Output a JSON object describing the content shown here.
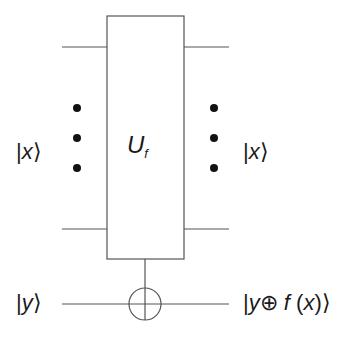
{
  "diagram": {
    "gate": {
      "name": "U",
      "subscript": "f"
    },
    "inputs": {
      "x_label_open": "|",
      "x_label_var": "x",
      "x_label_close": "⟩",
      "y_label_open": "|",
      "y_label_var": "y",
      "y_label_close": "⟩"
    },
    "outputs": {
      "x_label_open": "|",
      "x_label_var": "x",
      "x_label_close": "⟩",
      "y_label_open": "|",
      "y_expr_y": "y",
      "y_expr_xor": "⊕",
      "y_expr_f": "f",
      "y_expr_paren_open": " (",
      "y_expr_x": "x",
      "y_expr_paren_close": ")",
      "y_label_close": "⟩"
    },
    "colors": {
      "line": "#555555",
      "text": "#1a1a1a",
      "dot": "#111111",
      "background": "#ffffff"
    }
  }
}
